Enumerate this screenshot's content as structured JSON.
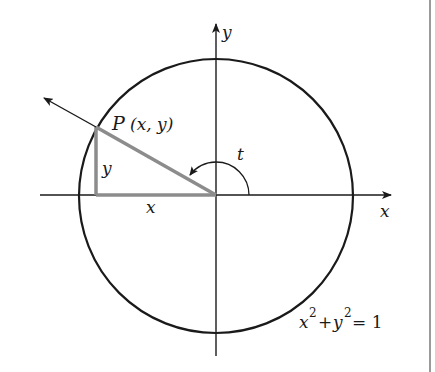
{
  "diagram": {
    "labels": {
      "y_axis": "y",
      "x_axis": "x",
      "point": "P",
      "point_coords": "(x, y)",
      "leg_vertical": "y",
      "leg_horizontal": "x",
      "angle": "t",
      "equation_x": "x",
      "equation_exp1": "2",
      "equation_plus": "+",
      "equation_y": "y",
      "equation_exp2": "2",
      "equation_rhs": "= 1"
    },
    "colors": {
      "ink": "#1a1a1a",
      "triangle": "#8c8c8c",
      "border": "#9a9a9a"
    }
  }
}
